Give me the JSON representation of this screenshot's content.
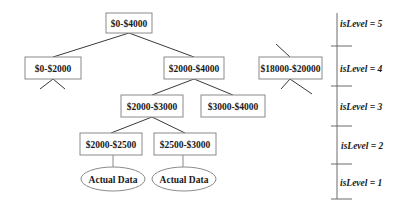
{
  "diagram": {
    "type": "tree",
    "nodes": [
      {
        "id": "n0",
        "label": "$0-$4000"
      },
      {
        "id": "n1",
        "label": "$0-$2000"
      },
      {
        "id": "n2",
        "label": "$2000-$4000"
      },
      {
        "id": "n3",
        "label": "$18000-$20000"
      },
      {
        "id": "n4",
        "label": "$2000-$3000"
      },
      {
        "id": "n5",
        "label": "$3000-$4000"
      },
      {
        "id": "n6",
        "label": "$2000-$2500"
      },
      {
        "id": "n7",
        "label": "$2500-$3000"
      }
    ],
    "leaves": [
      {
        "id": "l0",
        "label": "Actual Data",
        "parent": "n6"
      },
      {
        "id": "l1",
        "label": "Actual Data",
        "parent": "n7"
      }
    ],
    "edges": [
      [
        "n0",
        "n1"
      ],
      [
        "n0",
        "n2"
      ],
      [
        "n2",
        "n4"
      ],
      [
        "n2",
        "n5"
      ],
      [
        "n4",
        "n6"
      ],
      [
        "n4",
        "n7"
      ],
      [
        "n6",
        "l0"
      ],
      [
        "n7",
        "l1"
      ]
    ],
    "levels": [
      {
        "label": "isLevel = 5"
      },
      {
        "label": "isLevel = 4"
      },
      {
        "label": "isLevel = 3"
      },
      {
        "label": "isLevel = 2"
      },
      {
        "label": "isLevel = 1"
      }
    ]
  }
}
